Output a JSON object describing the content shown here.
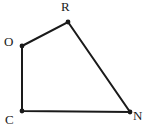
{
  "figure": {
    "kind": "geometry-diagram",
    "shape_name": "quadrilateral",
    "background_color": "#ffffff",
    "stroke_color": "#1a1a1a",
    "stroke_width": 2,
    "vertex_dot_color": "#1a1a1a",
    "vertex_dot_radius": 2.4,
    "label_color": "#1a1a1a",
    "vertices": [
      {
        "id": "O",
        "label": "O",
        "x": 22,
        "y": 46,
        "label_x": 4,
        "label_y": 35
      },
      {
        "id": "R",
        "label": "R",
        "x": 68,
        "y": 22,
        "label_x": 61,
        "label_y": 0
      },
      {
        "id": "N",
        "label": "N",
        "x": 130,
        "y": 112,
        "label_x": 133,
        "label_y": 109
      },
      {
        "id": "C",
        "label": "C",
        "x": 22,
        "y": 111,
        "label_x": 5,
        "label_y": 113
      }
    ],
    "edges": [
      {
        "id": "OR",
        "from": "O",
        "to": "R"
      },
      {
        "id": "RN",
        "from": "R",
        "to": "N"
      },
      {
        "id": "NC",
        "from": "N",
        "to": "C"
      },
      {
        "id": "CO",
        "from": "C",
        "to": "O"
      }
    ],
    "polygon_points": "22,46 68,22 130,112 22,111"
  }
}
